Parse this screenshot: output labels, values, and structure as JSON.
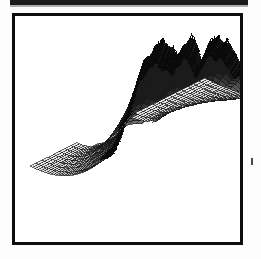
{
  "figure": {
    "caption": "",
    "frame_color": "#0d0d0d",
    "background_color": "#ffffff",
    "mesh_line_color": "#1a1a1a",
    "mesh_fill_light": "#c9c9c9",
    "mesh_fill_mid": "#a8a8a8",
    "ridge_color": "#0a0a0a"
  },
  "chart_data": {
    "type": "line",
    "title": "",
    "subtitle": "",
    "xlabel": "",
    "ylabel": "",
    "zlabel": "",
    "render": "3d-wireframe-surface",
    "projection": {
      "style": "oblique-parallel",
      "azimuth_deg": 38,
      "elevation_deg": 26
    },
    "grid": true,
    "legend": "none",
    "axes_visible": false,
    "tick_labels": [],
    "annotations": [],
    "mesh": {
      "rows": 26,
      "cols": 24,
      "front_left_corner": [
        27,
        163
      ],
      "front_notch_corner": [
        118,
        210
      ],
      "front_right_corner": [
        232,
        187
      ],
      "rear_left_corner": [
        62,
        62
      ],
      "rear_right_corner": [
        232,
        62
      ]
    },
    "x": [
      0,
      1,
      2,
      3,
      4,
      5,
      6,
      7,
      8,
      9,
      10,
      11,
      12,
      13,
      14,
      15,
      16,
      17,
      18,
      19,
      20,
      21,
      22,
      23
    ],
    "series": [
      {
        "name": "trace-00",
        "values": [
          0.02,
          0.03,
          0.04,
          0.05,
          0.06,
          0.07,
          0.08,
          0.09,
          0.1,
          0.11,
          0.12,
          0.13,
          0.14,
          0.15,
          0.16,
          0.17,
          0.18,
          0.19,
          0.2,
          0.21,
          0.22,
          0.23,
          0.24,
          0.25
        ]
      },
      {
        "name": "trace-01",
        "values": [
          0.03,
          0.05,
          0.07,
          0.09,
          0.11,
          0.13,
          0.15,
          0.17,
          0.19,
          0.21,
          0.23,
          0.25,
          0.27,
          0.29,
          0.31,
          0.32,
          0.33,
          0.34,
          0.35,
          0.36,
          0.37,
          0.38,
          0.39,
          0.4
        ]
      },
      {
        "name": "trace-02",
        "values": [
          0.05,
          0.08,
          0.11,
          0.14,
          0.17,
          0.2,
          0.23,
          0.26,
          0.29,
          0.32,
          0.35,
          0.38,
          0.41,
          0.43,
          0.45,
          0.47,
          0.48,
          0.49,
          0.5,
          0.51,
          0.52,
          0.53,
          0.54,
          0.55
        ]
      },
      {
        "name": "trace-03",
        "values": [
          0.08,
          0.12,
          0.17,
          0.22,
          0.27,
          0.32,
          0.36,
          0.4,
          0.44,
          0.47,
          0.5,
          0.53,
          0.56,
          0.58,
          0.6,
          0.61,
          0.62,
          0.63,
          0.64,
          0.65,
          0.66,
          0.67,
          0.68,
          0.69
        ]
      },
      {
        "name": "trace-04",
        "values": [
          0.12,
          0.18,
          0.25,
          0.32,
          0.38,
          0.44,
          0.49,
          0.53,
          0.57,
          0.6,
          0.63,
          0.66,
          0.68,
          0.7,
          0.71,
          0.72,
          0.73,
          0.74,
          0.75,
          0.76,
          0.77,
          0.78,
          0.79,
          0.8
        ]
      },
      {
        "name": "trace-05",
        "values": [
          0.18,
          0.26,
          0.35,
          0.43,
          0.5,
          0.56,
          0.61,
          0.65,
          0.69,
          0.72,
          0.74,
          0.76,
          0.78,
          0.79,
          0.8,
          0.81,
          0.82,
          0.83,
          0.84,
          0.85,
          0.86,
          0.86,
          0.87,
          0.88
        ]
      },
      {
        "name": "trace-06",
        "values": [
          0.26,
          0.36,
          0.46,
          0.55,
          0.62,
          0.68,
          0.72,
          0.76,
          0.79,
          0.81,
          0.83,
          0.85,
          0.86,
          0.87,
          0.88,
          0.89,
          0.89,
          0.9,
          0.9,
          0.91,
          0.91,
          0.92,
          0.92,
          0.93
        ]
      },
      {
        "name": "trace-07",
        "values": [
          0.36,
          0.47,
          0.58,
          0.66,
          0.73,
          0.78,
          0.82,
          0.85,
          0.87,
          0.89,
          0.9,
          0.91,
          0.92,
          0.93,
          0.93,
          0.94,
          0.94,
          0.95,
          0.95,
          0.95,
          0.96,
          0.96,
          0.96,
          0.97
        ]
      },
      {
        "name": "trace-08",
        "values": [
          0.48,
          0.6,
          0.7,
          0.77,
          0.83,
          0.87,
          0.9,
          0.92,
          0.93,
          0.94,
          0.95,
          0.95,
          0.96,
          0.96,
          0.97,
          0.97,
          0.97,
          0.98,
          0.98,
          0.98,
          0.98,
          0.99,
          0.99,
          0.99
        ]
      },
      {
        "name": "trace-09",
        "values": [
          0.6,
          0.72,
          0.81,
          0.87,
          0.91,
          0.94,
          0.95,
          0.96,
          0.97,
          0.97,
          0.98,
          0.98,
          0.98,
          0.99,
          0.99,
          0.99,
          0.99,
          0.99,
          1.0,
          1.0,
          1.0,
          1.0,
          1.0,
          1.0
        ]
      },
      {
        "name": "trace-10",
        "values": [
          0.72,
          0.83,
          0.9,
          0.94,
          0.96,
          0.97,
          0.98,
          0.99,
          0.99,
          0.99,
          1.0,
          1.0,
          1.0,
          1.0,
          1.0,
          1.0,
          1.0,
          1.0,
          1.0,
          1.0,
          1.0,
          1.0,
          1.0,
          1.0
        ]
      },
      {
        "name": "trace-11",
        "values": [
          0.83,
          0.91,
          0.96,
          0.98,
          0.99,
          1.0,
          1.0,
          1.0,
          1.0,
          1.0,
          1.0,
          1.0,
          1.0,
          1.0,
          1.0,
          1.0,
          1.0,
          1.0,
          1.0,
          1.0,
          1.0,
          1.0,
          1.0,
          1.0
        ]
      }
    ],
    "ridge_profile": {
      "name": "rear-jagged-ridge",
      "note": "Rough, noisy crest along the back of the surface; highest near the left, two rounded summits separated by a shallow notch, then a long serrated slope descending to the right.",
      "peaks": [
        {
          "x_px": 84,
          "y_px": 35,
          "label": "summit-1"
        },
        {
          "x_px": 112,
          "y_px": 38,
          "label": "summit-2"
        },
        {
          "x_px": 132,
          "y_px": 41,
          "label": "summit-3"
        }
      ],
      "notches": [
        {
          "x_px": 100,
          "y_px": 46,
          "label": "notch-1"
        },
        {
          "x_px": 122,
          "y_px": 45,
          "label": "notch-2"
        }
      ]
    }
  }
}
